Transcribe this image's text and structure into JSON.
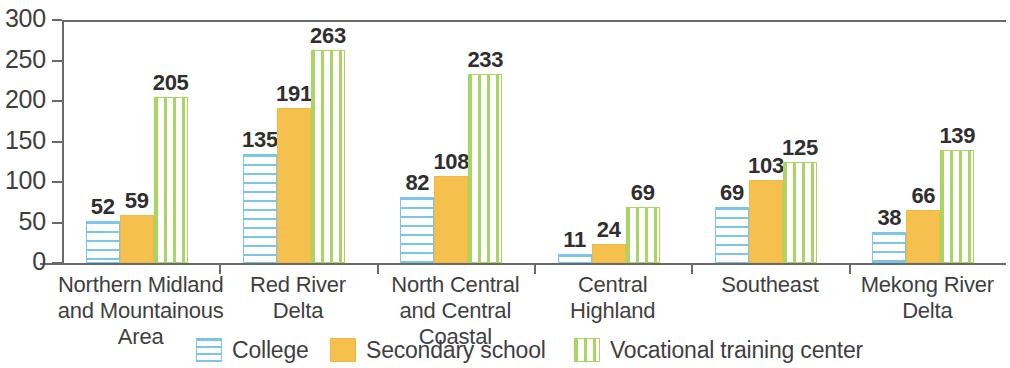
{
  "chart_data": {
    "type": "bar",
    "title": "",
    "xlabel": "",
    "ylabel": "",
    "ylim": [
      0,
      300
    ],
    "yticks": [
      0,
      50,
      100,
      150,
      200,
      250,
      300
    ],
    "grid": false,
    "legend_position": "bottom",
    "categories": [
      "Northern Midland\nand Mountainous\nArea",
      "Red River\nDelta",
      "North Central\nand Central Coastal",
      "Central\nHighland",
      "Southeast",
      "Mekong River\nDelta"
    ],
    "series": [
      {
        "name": "College",
        "color": "#79c6ea",
        "pattern": "horizontal-stripes",
        "values": [
          52,
          135,
          82,
          11,
          69,
          38
        ]
      },
      {
        "name": "Secondary school",
        "color": "#f5c04e",
        "pattern": "solid",
        "values": [
          59,
          191,
          108,
          24,
          103,
          66
        ]
      },
      {
        "name": "Vocational training center",
        "color": "#a9d662",
        "pattern": "vertical-stripes",
        "values": [
          205,
          263,
          233,
          69,
          125,
          139
        ]
      }
    ]
  },
  "axis": {
    "tick_labels": [
      "300",
      "250",
      "200",
      "150",
      "100",
      "50",
      "0"
    ]
  },
  "legend": {
    "items": [
      {
        "label": "College",
        "swatch": "college-swatch-icon"
      },
      {
        "label": "Secondary school",
        "swatch": "secondary-school-swatch-icon"
      },
      {
        "label": "Vocational training center",
        "swatch": "vocational-swatch-icon"
      }
    ]
  }
}
